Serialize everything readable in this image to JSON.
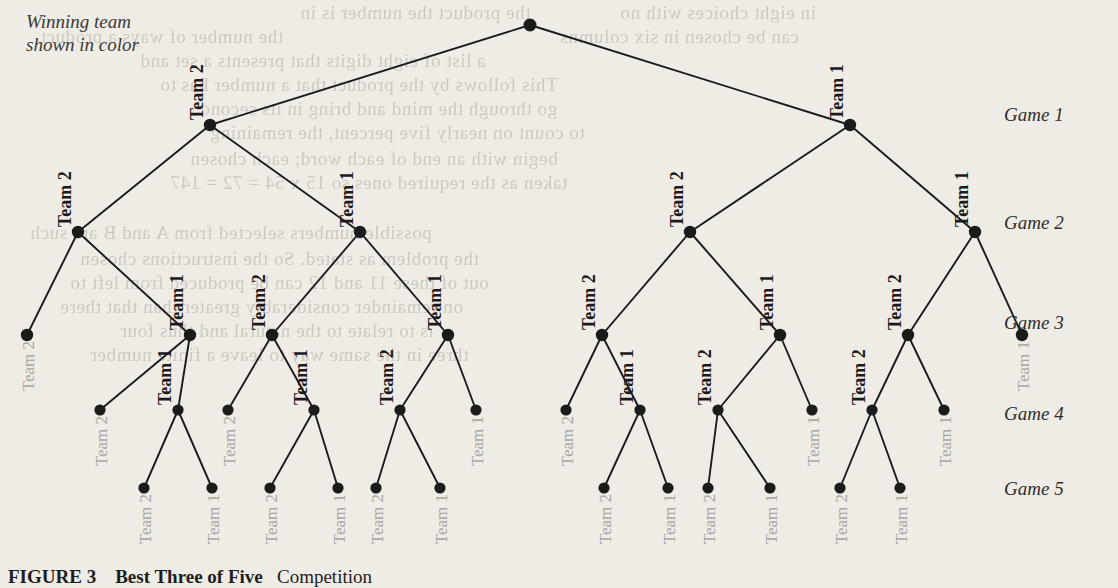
{
  "figure": {
    "note_line1": "Winning team",
    "note_line2": "shown in color",
    "caption_label": "FIGURE 3",
    "caption_title": "Best Three of Five",
    "caption_rest": "Competition"
  },
  "colors": {
    "paper": "#efece6",
    "ink": "#1b1b1b",
    "winner_label": "#1b1b1b",
    "loser_label": "#a9a7a2",
    "node": "#1b1b1b",
    "game_label": "#2d2d2d"
  },
  "round_labels": [
    {
      "id": "game-1",
      "text": "Game 1",
      "y": 104
    },
    {
      "id": "game-2",
      "text": "Game 2",
      "y": 212
    },
    {
      "id": "game-3",
      "text": "Game 3",
      "y": 312
    },
    {
      "id": "game-4",
      "text": "Game 4",
      "y": 403
    },
    {
      "id": "game-5",
      "text": "Game 5",
      "y": 478
    }
  ],
  "chart_data": {
    "type": "diagram",
    "subtitle": "Winning team shown in color",
    "levels": [
      "Game 1",
      "Game 2",
      "Game 3",
      "Game 4",
      "Game 5"
    ],
    "level_y": [
      125,
      232,
      335,
      410,
      488
    ],
    "root": {
      "id": "root",
      "x": 530,
      "y": 25
    },
    "nodes": [
      {
        "id": "n0",
        "x": 530,
        "y": 25,
        "level": 0,
        "label": "",
        "style": "none"
      },
      {
        "id": "n1",
        "x": 210,
        "y": 125,
        "level": 1,
        "label": "Team 2",
        "style": "winner",
        "lx": 203,
        "ly": 120
      },
      {
        "id": "n2",
        "x": 850,
        "y": 125,
        "level": 1,
        "label": "Team 1",
        "style": "winner",
        "lx": 843,
        "ly": 120
      },
      {
        "id": "n11",
        "x": 78,
        "y": 232,
        "level": 2,
        "label": "Team 2",
        "style": "winner",
        "lx": 71,
        "ly": 227
      },
      {
        "id": "n12",
        "x": 360,
        "y": 232,
        "level": 2,
        "label": "Team 1",
        "style": "winner",
        "lx": 353,
        "ly": 227
      },
      {
        "id": "n21",
        "x": 690,
        "y": 232,
        "level": 2,
        "label": "Team 2",
        "style": "winner",
        "lx": 683,
        "ly": 227
      },
      {
        "id": "n22",
        "x": 975,
        "y": 232,
        "level": 2,
        "label": "Team 1",
        "style": "winner",
        "lx": 968,
        "ly": 227
      },
      {
        "id": "n111",
        "x": 27,
        "y": 335,
        "level": 3,
        "label": "Team 2",
        "style": "loser",
        "lx": 34,
        "ly": 341
      },
      {
        "id": "n112",
        "x": 190,
        "y": 335,
        "level": 3,
        "label": "Team 1",
        "style": "winner",
        "lx": 183,
        "ly": 330
      },
      {
        "id": "n121",
        "x": 272,
        "y": 335,
        "level": 3,
        "label": "Team 2",
        "style": "winner",
        "lx": 265,
        "ly": 330
      },
      {
        "id": "n122",
        "x": 448,
        "y": 335,
        "level": 3,
        "label": "Team 1",
        "style": "winner",
        "lx": 441,
        "ly": 330
      },
      {
        "id": "n211",
        "x": 602,
        "y": 335,
        "level": 3,
        "label": "Team 2",
        "style": "winner",
        "lx": 595,
        "ly": 330
      },
      {
        "id": "n212",
        "x": 780,
        "y": 335,
        "level": 3,
        "label": "Team 1",
        "style": "winner",
        "lx": 773,
        "ly": 330
      },
      {
        "id": "n221",
        "x": 908,
        "y": 335,
        "level": 3,
        "label": "Team 2",
        "style": "winner",
        "lx": 901,
        "ly": 330
      },
      {
        "id": "n222",
        "x": 1022,
        "y": 335,
        "level": 3,
        "label": "Team 1",
        "style": "loser",
        "lx": 1029,
        "ly": 341
      },
      {
        "id": "n1121",
        "x": 100,
        "y": 410,
        "level": 4,
        "label": "Team 2",
        "style": "loser",
        "lx": 107,
        "ly": 416
      },
      {
        "id": "n1122",
        "x": 178,
        "y": 410,
        "level": 4,
        "label": "Team 1",
        "style": "winner",
        "lx": 171,
        "ly": 405
      },
      {
        "id": "n1211",
        "x": 228,
        "y": 410,
        "level": 4,
        "label": "Team 2",
        "style": "loser",
        "lx": 235,
        "ly": 416
      },
      {
        "id": "n1212",
        "x": 314,
        "y": 410,
        "level": 4,
        "label": "Team 1",
        "style": "winner",
        "lx": 307,
        "ly": 405
      },
      {
        "id": "n1221",
        "x": 400,
        "y": 410,
        "level": 4,
        "label": "Team 2",
        "style": "winner",
        "lx": 393,
        "ly": 405
      },
      {
        "id": "n1222",
        "x": 476,
        "y": 410,
        "level": 4,
        "label": "Team 1",
        "style": "loser",
        "lx": 483,
        "ly": 416
      },
      {
        "id": "n2111",
        "x": 566,
        "y": 410,
        "level": 4,
        "label": "Team 2",
        "style": "loser",
        "lx": 573,
        "ly": 416
      },
      {
        "id": "n2112",
        "x": 640,
        "y": 410,
        "level": 4,
        "label": "Team 1",
        "style": "winner",
        "lx": 633,
        "ly": 405
      },
      {
        "id": "n2121",
        "x": 718,
        "y": 410,
        "level": 4,
        "label": "Team 2",
        "style": "winner",
        "lx": 711,
        "ly": 405
      },
      {
        "id": "n2122",
        "x": 812,
        "y": 410,
        "level": 4,
        "label": "Team 1",
        "style": "loser",
        "lx": 819,
        "ly": 416
      },
      {
        "id": "n2211",
        "x": 872,
        "y": 410,
        "level": 4,
        "label": "Team 2",
        "style": "winner",
        "lx": 865,
        "ly": 405
      },
      {
        "id": "n2212",
        "x": 944,
        "y": 410,
        "level": 4,
        "label": "Team 1",
        "style": "loser",
        "lx": 951,
        "ly": 416
      },
      {
        "id": "L1",
        "x": 144,
        "y": 488,
        "level": 5,
        "label": "Team 2",
        "style": "loser",
        "lx": 151,
        "ly": 494
      },
      {
        "id": "L2",
        "x": 212,
        "y": 488,
        "level": 5,
        "label": "Team 1",
        "style": "loser",
        "lx": 219,
        "ly": 494
      },
      {
        "id": "L3",
        "x": 270,
        "y": 488,
        "level": 5,
        "label": "Team 2",
        "style": "loser",
        "lx": 277,
        "ly": 494
      },
      {
        "id": "L4",
        "x": 338,
        "y": 488,
        "level": 5,
        "label": "Team 1",
        "style": "loser",
        "lx": 345,
        "ly": 494
      },
      {
        "id": "L5",
        "x": 376,
        "y": 488,
        "level": 5,
        "label": "Team 2",
        "style": "loser",
        "lx": 383,
        "ly": 494
      },
      {
        "id": "L6",
        "x": 440,
        "y": 488,
        "level": 5,
        "label": "Team 1",
        "style": "loser",
        "lx": 447,
        "ly": 494
      },
      {
        "id": "L7",
        "x": 604,
        "y": 488,
        "level": 5,
        "label": "Team 2",
        "style": "loser",
        "lx": 611,
        "ly": 494
      },
      {
        "id": "L8",
        "x": 668,
        "y": 488,
        "level": 5,
        "label": "Team 1",
        "style": "loser",
        "lx": 675,
        "ly": 494
      },
      {
        "id": "L9",
        "x": 708,
        "y": 488,
        "level": 5,
        "label": "Team 2",
        "style": "loser",
        "lx": 715,
        "ly": 494
      },
      {
        "id": "L10",
        "x": 770,
        "y": 488,
        "level": 5,
        "label": "Team 1",
        "style": "loser",
        "lx": 777,
        "ly": 494
      },
      {
        "id": "L11",
        "x": 840,
        "y": 488,
        "level": 5,
        "label": "Team 2",
        "style": "loser",
        "lx": 847,
        "ly": 494
      },
      {
        "id": "L12",
        "x": 900,
        "y": 488,
        "level": 5,
        "label": "Team 1",
        "style": "loser",
        "lx": 907,
        "ly": 494
      }
    ],
    "edges": [
      [
        "n0",
        "n1"
      ],
      [
        "n0",
        "n2"
      ],
      [
        "n1",
        "n11"
      ],
      [
        "n1",
        "n12"
      ],
      [
        "n2",
        "n21"
      ],
      [
        "n2",
        "n22"
      ],
      [
        "n11",
        "n111"
      ],
      [
        "n11",
        "n112"
      ],
      [
        "n12",
        "n121"
      ],
      [
        "n12",
        "n122"
      ],
      [
        "n21",
        "n211"
      ],
      [
        "n21",
        "n212"
      ],
      [
        "n22",
        "n221"
      ],
      [
        "n22",
        "n222"
      ],
      [
        "n112",
        "n1121"
      ],
      [
        "n112",
        "n1122"
      ],
      [
        "n121",
        "n1211"
      ],
      [
        "n121",
        "n1212"
      ],
      [
        "n122",
        "n1221"
      ],
      [
        "n122",
        "n1222"
      ],
      [
        "n211",
        "n2111"
      ],
      [
        "n211",
        "n2112"
      ],
      [
        "n212",
        "n2121"
      ],
      [
        "n212",
        "n2122"
      ],
      [
        "n221",
        "n2211"
      ],
      [
        "n221",
        "n2212"
      ],
      [
        "n1122",
        "L1"
      ],
      [
        "n1122",
        "L2"
      ],
      [
        "n1212",
        "L3"
      ],
      [
        "n1212",
        "L4"
      ],
      [
        "n1221",
        "L5"
      ],
      [
        "n1221",
        "L6"
      ],
      [
        "n2112",
        "L7"
      ],
      [
        "n2112",
        "L8"
      ],
      [
        "n2121",
        "L9"
      ],
      [
        "n2121",
        "L10"
      ],
      [
        "n2211",
        "L11"
      ],
      [
        "n2211",
        "L12"
      ]
    ]
  },
  "bleed_text": [
    {
      "t": "the product the number is in",
      "x": 300,
      "y": 2
    },
    {
      "t": "in eight choices with no",
      "x": 620,
      "y": 2
    },
    {
      "t": "the number of ways a product",
      "x": 40,
      "y": 26
    },
    {
      "t": "can be chosen in six columns",
      "x": 560,
      "y": 26
    },
    {
      "t": "a list of eight digits that presents a set and",
      "x": 140,
      "y": 50
    },
    {
      "t": "This follows by the product that a number has to",
      "x": 160,
      "y": 74
    },
    {
      "t": "go through the mind and bring in its second",
      "x": 200,
      "y": 98
    },
    {
      "t": "to count on nearly five percent, the remaining",
      "x": 210,
      "y": 122
    },
    {
      "t": "begin with an end of each word; each chosen",
      "x": 190,
      "y": 148
    },
    {
      "t": "taken as the required ones so 15 x 54 = 72 = 147",
      "x": 170,
      "y": 172
    },
    {
      "t": "possible numbers selected from A and B are such",
      "x": 30,
      "y": 222
    },
    {
      "t": "the problem as stated. So the instructions chosen",
      "x": 80,
      "y": 248
    },
    {
      "t": "out of these 11 and 12 can be produced from left to",
      "x": 70,
      "y": 272
    },
    {
      "t": "on remainder considerably greater than that there",
      "x": 60,
      "y": 296
    },
    {
      "t": "is to relate to the natural and thus four",
      "x": 120,
      "y": 320
    },
    {
      "t": "three in the same way to leave a finite number",
      "x": 90,
      "y": 344
    }
  ]
}
